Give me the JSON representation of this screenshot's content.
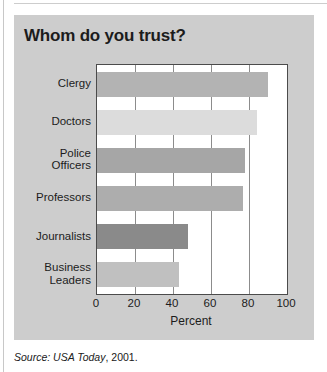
{
  "figure": {
    "title": "Whom do you trust?",
    "source_prefix": "Source:",
    "source_publication": "USA Today",
    "source_year": ", 2001."
  },
  "chart_data": {
    "type": "bar",
    "orientation": "horizontal",
    "title": "Whom do you trust?",
    "xlabel": "Percent",
    "ylabel": "",
    "xlim": [
      0,
      100
    ],
    "xticks": [
      0,
      20,
      40,
      60,
      80,
      100
    ],
    "xtick_labels": [
      "0",
      "20",
      "40",
      "60",
      "80",
      "100"
    ],
    "grid": "vertical gridlines at 20, 40, 60, 80",
    "legend": "none",
    "categories": [
      "Clergy",
      "Doctors",
      "Police Officers",
      "Professors",
      "Journalists",
      "Business Leaders"
    ],
    "category_lines": [
      [
        "Clergy"
      ],
      [
        "Doctors"
      ],
      [
        "Police",
        "Officers"
      ],
      [
        "Professors"
      ],
      [
        "Journalists"
      ],
      [
        "Business",
        "Leaders"
      ]
    ],
    "values": [
      90,
      84,
      78,
      77,
      48,
      43
    ],
    "bar_colors": [
      "#b3b3b3",
      "#dcdcdc",
      "#a6a6a6",
      "#adadad",
      "#8a8a8a",
      "#c0c0c0"
    ],
    "plot_background": "#ffffff",
    "panel_background": "#cdcdcd",
    "axis_color": "#4b4b4b",
    "gridline_color": "#8c8c8c"
  }
}
